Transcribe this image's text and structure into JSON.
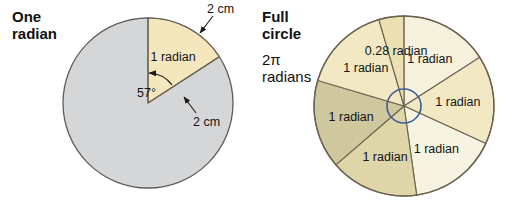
{
  "figure": {
    "background": "#ffffff",
    "width": 515,
    "height": 217
  },
  "left_panel": {
    "caption_line1": "One",
    "caption_line2": "radian",
    "circle": {
      "cx": 148,
      "cy": 103,
      "r": 85,
      "fill": "#d4d6d8",
      "stroke": "#5c5c5c"
    },
    "sector": {
      "label": "1 radian",
      "angle_degrees": 57,
      "angle_label": "57°",
      "start_angle_deg": 90,
      "fill": "#f4e7bd",
      "stroke": "#6b6250"
    },
    "radius_label": "2 cm",
    "arc_label": "2 cm"
  },
  "right_panel": {
    "caption_line1": "Full",
    "caption_line2": "circle",
    "caption_line3": "2π",
    "caption_line4": "radians",
    "circle": {
      "cx": 404,
      "cy": 106,
      "r": 90,
      "stroke": "#6b6250"
    },
    "inner_circle": {
      "cx": 404,
      "cy": 106,
      "r": 17,
      "stroke": "#3f5c96",
      "fill": "none"
    },
    "sectors": [
      {
        "label": "1 radian",
        "span_deg": 57.3,
        "fill": "#f6f1dc"
      },
      {
        "label": "1 radian",
        "span_deg": 57.3,
        "fill": "#f2e9c4"
      },
      {
        "label": "1 radian",
        "span_deg": 57.3,
        "fill": "#f7f3e2"
      },
      {
        "label": "1 radian",
        "span_deg": 57.3,
        "fill": "#ded5a8"
      },
      {
        "label": "1 radian",
        "span_deg": 57.3,
        "fill": "#cfc79e"
      },
      {
        "label": "1 radian",
        "span_deg": 57.3,
        "fill": "#f2e9c4"
      },
      {
        "label": "0.28 radian",
        "span_deg": 16.04,
        "fill": "#ecdfb0"
      }
    ]
  },
  "chart_data": {
    "type": "pie",
    "charts": [
      {
        "name": "One radian",
        "description": "Circle of radius 2 cm with one sector of 1 radian highlighted",
        "radius_cm": 2,
        "categories": [
          "1 radian sector",
          "remainder"
        ],
        "values": [
          57.3,
          302.7
        ],
        "unit": "degrees",
        "annotations": [
          "2 cm",
          "2 cm",
          "57°",
          "1 radian"
        ]
      },
      {
        "name": "Full circle",
        "description": "Full circle of 2π radians divided into six 1-radian sectors plus one 0.28 radian sector",
        "total_radians": 6.28,
        "categories": [
          "1 radian",
          "1 radian",
          "1 radian",
          "1 radian",
          "1 radian",
          "1 radian",
          "0.28 radian"
        ],
        "values": [
          1,
          1,
          1,
          1,
          1,
          1,
          0.28
        ],
        "unit": "radians",
        "annotations": [
          "2π radians"
        ]
      }
    ]
  }
}
